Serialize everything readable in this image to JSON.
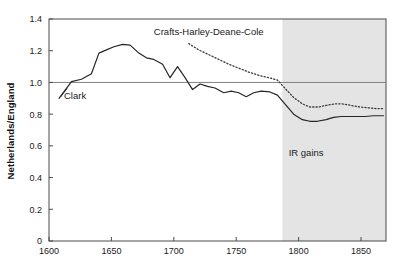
{
  "chart_data": {
    "type": "line",
    "title": "",
    "subtitle": "",
    "xlabel": "",
    "ylabel": "Netherlands/England",
    "xlim": [
      1600,
      1870
    ],
    "ylim": [
      0,
      1.4
    ],
    "xticks": [
      1600,
      1650,
      1700,
      1750,
      1800,
      1850
    ],
    "xtick_labels": [
      "1600",
      "1650",
      "1700",
      "1750",
      "1800",
      "1850"
    ],
    "yticks": [
      0,
      0.2,
      0.4,
      0.6,
      0.8,
      1.0,
      1.2,
      1.4
    ],
    "ytick_labels": [
      "0",
      "0.2",
      "0.4",
      "0.6",
      "0.8",
      "1.0",
      "1.2",
      "1.4"
    ],
    "grid": false,
    "reference_lines": [
      {
        "name": "parity-line",
        "axis": "y",
        "value": 1.0,
        "color": "#808080"
      }
    ],
    "shaded_regions": [
      {
        "name": "ir-gains-band",
        "axis": "x",
        "from": 1787,
        "to": 1870,
        "color": "#e4e4e4",
        "label": "IR gains"
      }
    ],
    "legend_position": "inline-annotations",
    "annotations": [
      {
        "name": "clark-label",
        "text": "Clark",
        "x": 1612,
        "y": 0.895
      },
      {
        "name": "chdc-label",
        "text": "Crafts-Harley-Deane-Cole",
        "x": 1684,
        "y": 1.3
      },
      {
        "name": "ir-gains-label",
        "text": "IR gains",
        "x": 1806,
        "y": 0.535
      }
    ],
    "series": [
      {
        "name": "Clark",
        "style": "solid",
        "color": "#262626",
        "x": [
          1608,
          1618,
          1626,
          1634,
          1640,
          1646,
          1652,
          1659,
          1665,
          1672,
          1678,
          1684,
          1691,
          1697,
          1703,
          1709,
          1715,
          1721,
          1727,
          1733,
          1740,
          1746,
          1752,
          1758,
          1764,
          1770,
          1777,
          1783,
          1790,
          1796,
          1803,
          1809,
          1815,
          1822,
          1828,
          1834,
          1841,
          1847,
          1853,
          1860,
          1868
        ],
        "y": [
          0.9,
          1.005,
          1.02,
          1.055,
          1.185,
          1.205,
          1.225,
          1.24,
          1.235,
          1.185,
          1.155,
          1.145,
          1.115,
          1.03,
          1.1,
          1.03,
          0.955,
          0.99,
          0.975,
          0.965,
          0.935,
          0.945,
          0.935,
          0.91,
          0.935,
          0.945,
          0.94,
          0.92,
          0.855,
          0.8,
          0.765,
          0.755,
          0.755,
          0.765,
          0.78,
          0.785,
          0.785,
          0.785,
          0.785,
          0.79,
          0.79
        ]
      },
      {
        "name": "Crafts-Harley-Deane-Cole",
        "style": "dotted",
        "color": "#3a3a3a",
        "x": [
          1712,
          1720,
          1728,
          1736,
          1744,
          1752,
          1760,
          1768,
          1776,
          1783,
          1790,
          1796,
          1803,
          1809,
          1816,
          1822,
          1829,
          1835,
          1842,
          1849,
          1856,
          1862,
          1868
        ],
        "y": [
          1.245,
          1.205,
          1.175,
          1.145,
          1.115,
          1.09,
          1.065,
          1.045,
          1.03,
          1.015,
          0.955,
          0.905,
          0.865,
          0.845,
          0.845,
          0.855,
          0.865,
          0.865,
          0.855,
          0.845,
          0.84,
          0.835,
          0.835
        ]
      }
    ]
  },
  "axes": {
    "frame_color": "#4a4a4a",
    "background": "#ffffff"
  }
}
